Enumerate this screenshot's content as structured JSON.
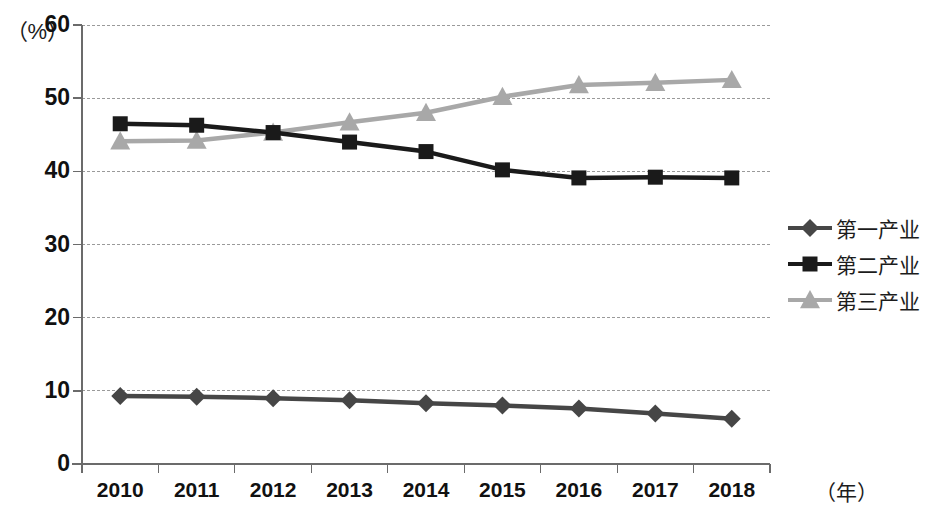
{
  "chart_data": {
    "type": "line",
    "title": "",
    "xlabel": "（年）",
    "ylabel": "（%）",
    "ylim": [
      0,
      60
    ],
    "ytick_step": 10,
    "yticks": [
      "0",
      "10",
      "20",
      "30",
      "40",
      "50",
      "60"
    ],
    "grid": true,
    "legend_position": "right",
    "categories": [
      "2010",
      "2011",
      "2012",
      "2013",
      "2014",
      "2015",
      "2016",
      "2017",
      "2018"
    ],
    "series": [
      {
        "name": "第一产业",
        "marker": "diamond",
        "color": "#464646",
        "values": [
          9.3,
          9.2,
          9.0,
          8.7,
          8.3,
          8.0,
          7.6,
          6.9,
          6.2
        ]
      },
      {
        "name": "第二产业",
        "marker": "square",
        "color": "#1a1a1a",
        "values": [
          46.5,
          46.3,
          45.3,
          44.0,
          42.7,
          40.2,
          39.1,
          39.2,
          39.1
        ]
      },
      {
        "name": "第三产业",
        "marker": "triangle",
        "color": "#a8a8a8",
        "values": [
          44.1,
          44.2,
          45.3,
          46.7,
          48.0,
          50.2,
          51.8,
          52.1,
          52.5
        ]
      }
    ]
  },
  "axes": {
    "y_unit_label": "（%）",
    "x_unit_label": "（年）"
  },
  "colors": {
    "grid": "#9a9a9a",
    "axis": "#6b6b6b",
    "text": "#1c1c1c"
  }
}
